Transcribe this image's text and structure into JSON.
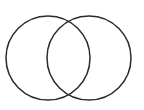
{
  "diagram": {
    "type": "venn",
    "background": "#ffffff",
    "stroke_color": "#2a2a2a",
    "stroke_width": 1.5,
    "circles": [
      {
        "name": "left",
        "cx": 48,
        "cy": 58,
        "r": 42
      },
      {
        "name": "right",
        "cx": 89,
        "cy": 58,
        "r": 42
      }
    ]
  }
}
